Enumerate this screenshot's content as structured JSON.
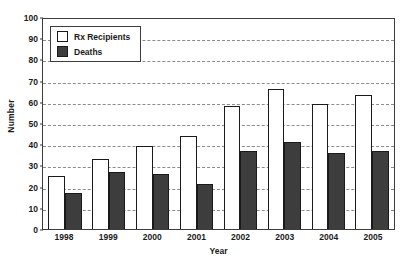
{
  "chart_data": {
    "type": "bar",
    "title": "",
    "subtitle": "",
    "xlabel": "Year",
    "ylabel": "Number",
    "categories": [
      "1998",
      "1999",
      "2000",
      "2001",
      "2002",
      "2003",
      "2004",
      "2005"
    ],
    "series": [
      {
        "name": "Rx Recipients",
        "values": [
          25,
          33,
          39,
          44,
          58,
          66,
          59,
          63
        ],
        "fill": "#ffffff",
        "stroke": "#1a1a1a"
      },
      {
        "name": "Deaths",
        "values": [
          17,
          27,
          26,
          21,
          37,
          41,
          36,
          37
        ],
        "fill": "#3d3d3d",
        "stroke": "#1a1a1a"
      }
    ],
    "ylim": [
      0,
      100
    ],
    "ytick_values": [
      0,
      10,
      20,
      30,
      40,
      50,
      60,
      70,
      80,
      90,
      100
    ],
    "ytick_labels": [
      "0",
      "10",
      "20",
      "30",
      "40",
      "50",
      "60",
      "70",
      "80",
      "90",
      "100"
    ],
    "grid": true,
    "grid_axis": "y",
    "grid_style": "dashed",
    "grid_color": "#8c8c8c",
    "legend_position": "top-left",
    "legend_entries": [
      "Rx Recipients",
      "Deaths"
    ],
    "annotations": [],
    "axis_color": "#3d3d3d",
    "background": "#ffffff"
  }
}
